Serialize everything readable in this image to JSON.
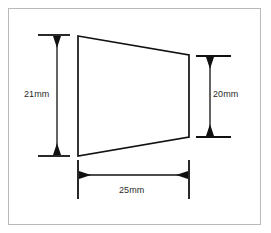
{
  "drawing": {
    "title": "Trapezoid dimensioned technical drawing",
    "frame": {
      "name": "border-frame",
      "stroke_color": "#b9b9b9",
      "x": 8,
      "y": 8,
      "width": 253,
      "height": 217
    },
    "shape": {
      "name": "trapezoid",
      "type": "trapezoid",
      "stroke_color": "#111111",
      "fill": "none",
      "vertices": [
        {
          "label": "top-left",
          "x": 78,
          "y": 36
        },
        {
          "label": "top-right",
          "x": 189,
          "y": 55
        },
        {
          "label": "bottom-right",
          "x": 189,
          "y": 137
        },
        {
          "label": "bottom-left",
          "x": 78,
          "y": 156
        }
      ]
    },
    "dimensions": [
      {
        "id": "left-height",
        "label": "21mm",
        "value": 21,
        "unit": "mm",
        "orientation": "vertical",
        "measures": "left edge height",
        "arrow_line_x": 57,
        "from_y": 35,
        "to_y": 156,
        "extension_ticks": [
          {
            "y": 35,
            "x1": 38,
            "x2": 70
          },
          {
            "y": 156,
            "x1": 38,
            "x2": 70
          }
        ],
        "arrows": [
          "down-at-top",
          "down-at-bottom"
        ]
      },
      {
        "id": "right-height",
        "label": "20mm",
        "value": 20,
        "unit": "mm",
        "orientation": "vertical",
        "measures": "right edge height",
        "arrow_line_x": 210,
        "from_y": 56,
        "to_y": 137,
        "extension_ticks": [
          {
            "y": 56,
            "x1": 196,
            "x2": 231
          },
          {
            "y": 137,
            "x1": 196,
            "x2": 231
          }
        ],
        "arrows": [
          "up-at-top",
          "down-at-bottom"
        ]
      },
      {
        "id": "bottom-width",
        "label": "25mm",
        "value": 25,
        "unit": "mm",
        "orientation": "horizontal",
        "measures": "overall width",
        "arrow_line_y": 175,
        "from_x": 78,
        "to_x": 189,
        "extension_ticks": [
          {
            "x": 78,
            "y1": 160,
            "y2": 199
          },
          {
            "x": 189,
            "y1": 160,
            "y2": 199
          }
        ],
        "arrows": [
          "left-at-start",
          "right-at-end"
        ]
      }
    ],
    "colors": {
      "line": "#111111",
      "frame": "#b9b9b9",
      "text": "#2b2b2b",
      "background": "#ffffff"
    }
  }
}
